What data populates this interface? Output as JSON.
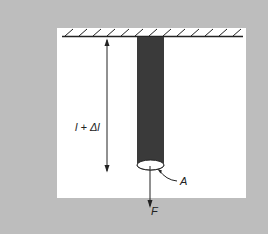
{
  "diagram": {
    "labels": {
      "length": "l + Δl",
      "area": "A",
      "force": "F"
    },
    "elements": [
      "fixed-support-ceiling",
      "rod",
      "length-arrow",
      "cross-section-ellipse",
      "force-arrow",
      "area-leader-line"
    ],
    "colors": {
      "background": "#bdbdbd",
      "panel": "#ffffff",
      "rod": "#3a3a3a",
      "lines": "#222222"
    }
  }
}
